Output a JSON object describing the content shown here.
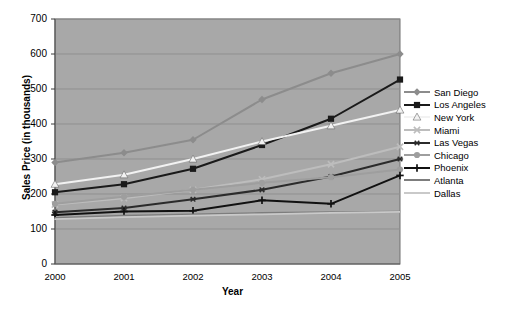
{
  "chart_data": {
    "type": "line",
    "title": "",
    "xlabel": "Year",
    "ylabel": "Sales Price (in thousands)",
    "categories": [
      "2000",
      "2001",
      "2002",
      "2003",
      "2004",
      "2005"
    ],
    "x": [
      2000,
      2001,
      2002,
      2003,
      2004,
      2005
    ],
    "xlim": [
      2000,
      2005
    ],
    "ylim": [
      0,
      700
    ],
    "yticks": [
      0,
      100,
      200,
      300,
      400,
      500,
      600,
      700
    ],
    "grid": true,
    "legend_position": "right",
    "plot_background": "#a8a8a8",
    "series": [
      {
        "name": "San Diego",
        "color": "#8c8c8c",
        "marker": "diamond",
        "values": [
          290,
          318,
          355,
          470,
          545,
          600
        ]
      },
      {
        "name": "Los Angeles",
        "color": "#1a1a1a",
        "marker": "square",
        "values": [
          205,
          228,
          272,
          340,
          415,
          527
        ]
      },
      {
        "name": "New York",
        "color": "#f2f2f2",
        "marker": "triangle",
        "values": [
          228,
          255,
          300,
          350,
          395,
          440
        ]
      },
      {
        "name": "Miami",
        "color": "#bdbdbd",
        "marker": "cross",
        "values": [
          170,
          188,
          212,
          242,
          285,
          335
        ]
      },
      {
        "name": "Las Vegas",
        "color": "#2b2b2b",
        "marker": "star",
        "values": [
          148,
          160,
          185,
          212,
          250,
          300
        ]
      },
      {
        "name": "Chicago",
        "color": "#9e9e9e",
        "marker": "circle",
        "values": [
          172,
          192,
          212,
          232,
          248,
          270
        ]
      },
      {
        "name": "Phoenix",
        "color": "#111111",
        "marker": "plus",
        "values": [
          140,
          150,
          152,
          182,
          172,
          253
        ]
      },
      {
        "name": "Atlanta",
        "color": "#7d7d7d",
        "marker": "none",
        "values": [
          132,
          138,
          142,
          146,
          148,
          150
        ]
      },
      {
        "name": "Dallas",
        "color": "#c9c9c9",
        "marker": "none",
        "values": [
          128,
          134,
          138,
          142,
          146,
          149
        ]
      }
    ]
  }
}
